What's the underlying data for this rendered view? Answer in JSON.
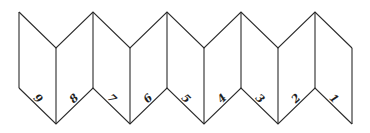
{
  "diagram": {
    "type": "accordion-fold-strip",
    "stroke_color": "#2a2a2a",
    "vertices_x": [
      19,
      56,
      93,
      130,
      167,
      204,
      241,
      278,
      315,
      352
    ],
    "high_top": 12,
    "low_top": 48,
    "high_bottom": 88,
    "low_bottom": 124,
    "panels": [
      {
        "label": "9"
      },
      {
        "label": "8"
      },
      {
        "label": "7"
      },
      {
        "label": "6"
      },
      {
        "label": "5"
      },
      {
        "label": "4"
      },
      {
        "label": "3"
      },
      {
        "label": "2"
      },
      {
        "label": "1"
      }
    ]
  }
}
